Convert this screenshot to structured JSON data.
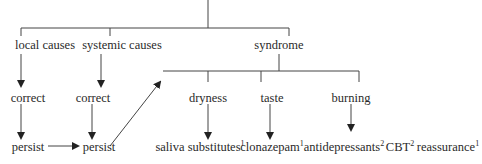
{
  "diagram": {
    "nodes": {
      "local_causes": "local causes",
      "systemic_causes": "systemic causes",
      "syndrome": "syndrome",
      "correct_local": "correct",
      "correct_systemic": "correct",
      "dryness": "dryness",
      "taste": "taste",
      "burning": "burning",
      "persist_local": "persist",
      "persist_systemic": "persist",
      "saliva_substitutes": "saliva substitutes",
      "saliva_substitutes_ref": "1",
      "clonazepam": "clonazepam",
      "clonazepam_ref": "1",
      "antidepressants": "antidepressants",
      "antidepressants_ref": "2",
      "cbt": "CBT",
      "cbt_ref": "2",
      "reassurance": "reassurance",
      "reassurance_ref": "1"
    },
    "line_color": "#333333"
  }
}
